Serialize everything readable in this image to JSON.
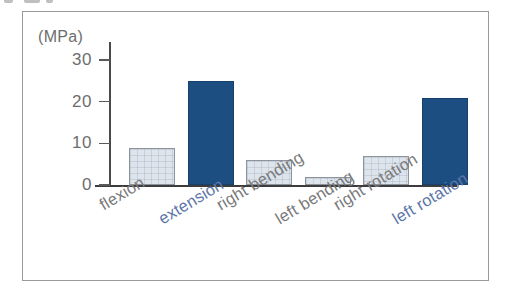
{
  "figure": {
    "frame_border_color": "#9a9a9a",
    "background_color": "#ffffff"
  },
  "chart_data": {
    "type": "bar",
    "title": "",
    "subtitle": "",
    "xlabel": "",
    "ylabel": "",
    "unit_label": "(MPa)",
    "categories": [
      "flexion",
      "extension",
      "right bending",
      "left bending",
      "right rotation",
      "left rotation"
    ],
    "values": [
      9,
      25,
      6,
      2,
      7,
      21
    ],
    "ylim": [
      0,
      30
    ],
    "ytick_labels": [
      "30",
      "20",
      "10",
      "0"
    ],
    "yticks": [
      30,
      20,
      10,
      0
    ],
    "grid": false,
    "legend": "none",
    "series": [
      {
        "name": "peak stress",
        "values": [
          9,
          25,
          6,
          2,
          7,
          21
        ]
      }
    ],
    "bar_styles": [
      "light",
      "dark",
      "light",
      "light",
      "light",
      "dark"
    ],
    "label_styles": [
      "gray",
      "blue",
      "gray",
      "gray",
      "gray",
      "blue"
    ],
    "colors": {
      "dark_bar": "#1d4e82",
      "dark_bar_border": "#16406e",
      "light_bar": "#dde4ec",
      "light_bar_border": "#8d949c",
      "axis": "#3c3c3c",
      "tick_text": "#6d6d6d",
      "label_gray": "#7a7a7a",
      "label_blue": "#5d76a9"
    }
  }
}
